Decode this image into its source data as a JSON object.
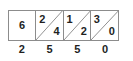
{
  "diagram": {
    "type": "lattice-multiplication-row",
    "colors": {
      "border": "#8c8c8c",
      "digit": "#221f1f",
      "background": "#ffffff"
    },
    "cells": [
      {
        "has_diagonal": false,
        "center": "6",
        "upper_left": "",
        "lower_right": ""
      },
      {
        "has_diagonal": true,
        "center": "",
        "upper_left": "2",
        "lower_right": "4"
      },
      {
        "has_diagonal": true,
        "center": "",
        "upper_left": "1",
        "lower_right": "2"
      },
      {
        "has_diagonal": true,
        "center": "",
        "upper_left": "3",
        "lower_right": "0"
      }
    ],
    "bottom_labels": [
      "2",
      "5",
      "5",
      "0"
    ]
  }
}
